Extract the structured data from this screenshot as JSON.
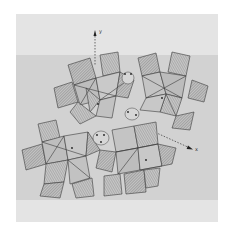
{
  "figure": {
    "type": "crystal-structure-polyhedral-projection",
    "axes": [
      {
        "label": "y",
        "direction": "up"
      },
      {
        "label": "x",
        "direction": "down-right"
      }
    ],
    "colors": {
      "page": "#e4e4e4",
      "band": "#d2d2d2",
      "polyhedron_fill": "#bdbdbd",
      "hatch": "#6e6e6e",
      "edge": "#3a3a3a",
      "atom": "#1e1e1e"
    }
  }
}
